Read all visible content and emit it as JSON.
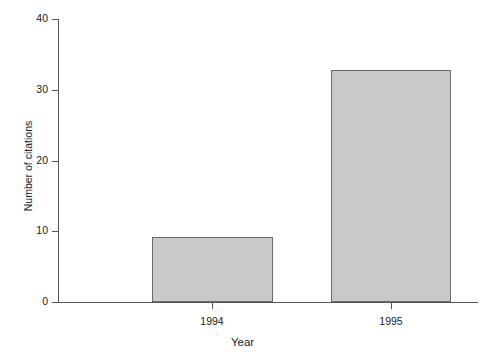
{
  "chart_data": {
    "type": "bar",
    "title": "",
    "xlabel": "Year",
    "ylabel": "Number of citations",
    "categories": [
      "1994",
      "1995"
    ],
    "values": [
      9.2,
      32.8
    ],
    "series": [
      {
        "name": "Number of citations",
        "values": [
          9.2,
          32.8
        ]
      }
    ],
    "ylim": [
      0,
      40
    ],
    "yticks": [
      0,
      10,
      20,
      30,
      40
    ],
    "ytick_labels": [
      "0",
      "10",
      "20",
      "30",
      "40"
    ],
    "xtick_labels": [
      "1994",
      "1995"
    ],
    "grid": false,
    "legend": false,
    "legend_position": "none",
    "bar_fill_color": "#c9c9c9",
    "bar_edge_color": "#6a6a6a",
    "axis_color": "#555555",
    "background_color": "#ffffff"
  }
}
